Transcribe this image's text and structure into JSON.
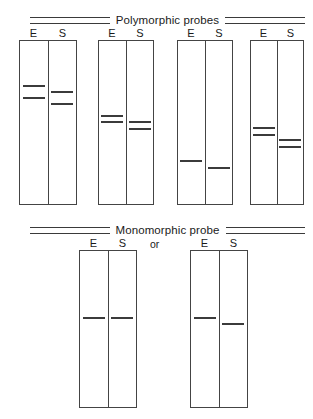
{
  "figure": {
    "sections": [
      {
        "id": "polymorphic",
        "title": "Polymorphic probes",
        "header_y": 12
      },
      {
        "id": "monomorphic",
        "title": "Monomorphic probe",
        "header_y": 222
      }
    ],
    "separator_label": "or",
    "lane_labels": {
      "e": "E",
      "s": "S"
    },
    "colors": {
      "band": "#3b3b3b",
      "box_border": "#444444",
      "rule": "#3a3a3a",
      "text": "#1a1a1a",
      "background": "#ffffff"
    },
    "panels": [
      {
        "id": "panel-1",
        "section": "polymorphic",
        "x": 19,
        "y": 26,
        "width": 58,
        "height": 179,
        "lane_e_label": "E",
        "lane_s_label": "S",
        "bands_e": [
          44,
          56
        ],
        "bands_s": [
          50,
          62
        ]
      },
      {
        "id": "panel-2",
        "section": "polymorphic",
        "x": 98,
        "y": 26,
        "width": 56,
        "height": 179,
        "lane_e_label": "E",
        "lane_s_label": "S",
        "bands_e": [
          74,
          80
        ],
        "bands_s": [
          80,
          87
        ]
      },
      {
        "id": "panel-3",
        "section": "polymorphic",
        "x": 177,
        "y": 26,
        "width": 56,
        "height": 179,
        "lane_e_label": "E",
        "lane_s_label": "S",
        "bands_e": [
          119
        ],
        "bands_s": [
          126
        ]
      },
      {
        "id": "panel-4",
        "section": "polymorphic",
        "x": 250,
        "y": 26,
        "width": 54,
        "height": 179,
        "lane_e_label": "E",
        "lane_s_label": "S",
        "bands_e": [
          86,
          93
        ],
        "bands_s": [
          98,
          105
        ]
      },
      {
        "id": "panel-5",
        "section": "monomorphic",
        "x": 79,
        "y": 236,
        "width": 58,
        "height": 172,
        "lane_e_label": "E",
        "lane_s_label": "S",
        "bands_e": [
          66
        ],
        "bands_s": [
          66
        ]
      },
      {
        "id": "panel-6",
        "section": "monomorphic",
        "x": 190,
        "y": 236,
        "width": 58,
        "height": 172,
        "lane_e_label": "E",
        "lane_s_label": "S",
        "bands_e": [
          66
        ],
        "bands_s": [
          72
        ]
      }
    ],
    "separator": {
      "x": 150,
      "y": 238
    }
  }
}
